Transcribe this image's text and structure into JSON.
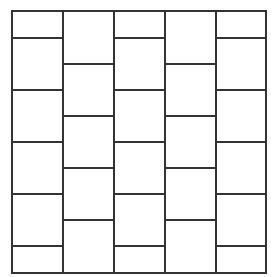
{
  "diagram": {
    "type": "staggered-brick-grid",
    "line_color": "#333333",
    "line_width": 2,
    "frame": {
      "left": 11,
      "top": 10,
      "right": 265,
      "bottom": 272
    },
    "columns": [
      {
        "x0": 11,
        "x1": 62,
        "horizontals": [
          37,
          89,
          141,
          193,
          245
        ]
      },
      {
        "x0": 62,
        "x1": 113,
        "horizontals": [
          63,
          115,
          167,
          219
        ]
      },
      {
        "x0": 113,
        "x1": 164,
        "horizontals": [
          37,
          89,
          141,
          193,
          245
        ]
      },
      {
        "x0": 164,
        "x1": 215,
        "horizontals": [
          63,
          115,
          167,
          219
        ]
      },
      {
        "x0": 215,
        "x1": 265,
        "horizontals": [
          37,
          89,
          141,
          193,
          245
        ]
      }
    ]
  }
}
